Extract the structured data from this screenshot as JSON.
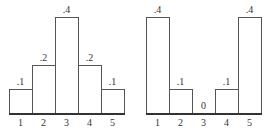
{
  "chart_data": [
    {
      "type": "bar",
      "title": "",
      "xlabel": "",
      "ylabel": "",
      "categories": [
        "1",
        "2",
        "3",
        "4",
        "5"
      ],
      "values": [
        0.1,
        0.2,
        0.4,
        0.2,
        0.1
      ],
      "value_labels": [
        ".1",
        ".2",
        ".4",
        ".2",
        ".1"
      ],
      "ylim": [
        0,
        0.4
      ],
      "grid": false,
      "legend": null
    },
    {
      "type": "bar",
      "title": "",
      "xlabel": "",
      "ylabel": "",
      "categories": [
        "1",
        "2",
        "3",
        "4",
        "5"
      ],
      "values": [
        0.4,
        0.1,
        0,
        0.1,
        0.4
      ],
      "value_labels": [
        ".4",
        ".1",
        "0",
        ".1",
        ".4"
      ],
      "ylim": [
        0,
        0.4
      ],
      "grid": false,
      "legend": null
    }
  ],
  "style": {
    "bar_border_color": "#555555",
    "bar_fill_color": "#ffffff",
    "axis_color": "#333333"
  }
}
